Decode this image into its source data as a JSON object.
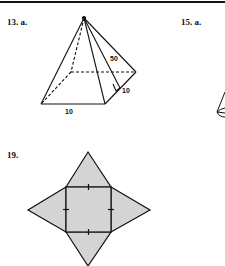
{
  "problems": [
    {
      "number": "13.",
      "part": "a.",
      "figure": "square-pyramid",
      "dimensions": {
        "slant_height": "50",
        "base_side_right": "10",
        "base_side_front": "10"
      }
    },
    {
      "number": "15.",
      "part": "a.",
      "figure": "cone-partial"
    },
    {
      "number": "19.",
      "part": "",
      "figure": "square-pyramid-net"
    }
  ],
  "colors": {
    "line": "#111111",
    "fill": "#d4d4d4",
    "background": "#ffffff"
  }
}
